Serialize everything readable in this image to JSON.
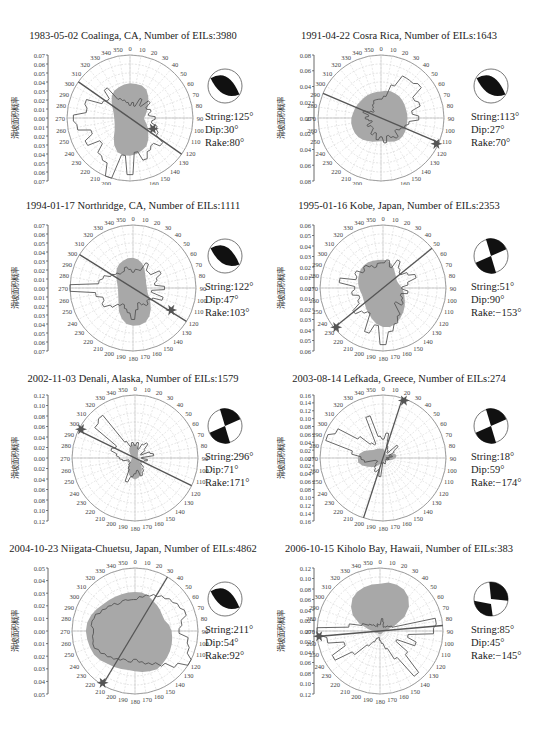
{
  "ylabel": "滑坡面积概率",
  "chart_data": [
    {
      "type": "rose",
      "title": "1983-05-02 Coalinga, CA, Number of EILs:3980",
      "event": "1983-05-02 Coalinga, CA",
      "num_eils": 3980,
      "ylabel": "滑坡面积概率",
      "yticks": [
        "0.07",
        "0.06",
        "0.05",
        "0.04",
        "0.03",
        "0.02",
        "0.01",
        "0.00",
        "0.01",
        "0.02",
        "0.03",
        "0.04",
        "0.05",
        "0.06",
        "0.07"
      ],
      "ylim": [
        0,
        0.07
      ],
      "angle_ticks": [
        0,
        10,
        20,
        30,
        40,
        50,
        60,
        70,
        80,
        90,
        100,
        110,
        120,
        130,
        140,
        150,
        160,
        170,
        180,
        190,
        200,
        210,
        220,
        230,
        240,
        250,
        260,
        270,
        280,
        290,
        300,
        310,
        320,
        330,
        340,
        350
      ],
      "focal_mechanism": {
        "strike": "String:125°",
        "dip": "Dip:30°",
        "rake": "Rake:80°"
      },
      "fault_line_azimuth": 125,
      "epicenter_azimuth": 115
    },
    {
      "type": "rose",
      "title": "1991-04-22 Cosra Rica, Number of EILs:1643",
      "event": "1991-04-22 Cosra Rica",
      "num_eils": 1643,
      "ylabel": "滑坡面积概率",
      "yticks": [
        "0.08",
        "0.06",
        "0.04",
        "0.02",
        "0.00",
        "0.02",
        "0.04",
        "0.06",
        "0.08"
      ],
      "ylim": [
        0,
        0.08
      ],
      "angle_ticks": [
        0,
        10,
        20,
        30,
        40,
        50,
        60,
        70,
        80,
        90,
        100,
        110,
        120,
        130,
        140,
        150,
        160,
        170,
        180,
        190,
        200,
        210,
        220,
        230,
        240,
        250,
        260,
        270,
        280,
        290,
        300,
        310,
        320,
        330,
        340,
        350
      ],
      "focal_mechanism": {
        "strike": "String:113°",
        "dip": "Dip:27°",
        "rake": "Rake:70°"
      },
      "fault_line_azimuth": 113,
      "epicenter_azimuth": 115
    },
    {
      "type": "rose",
      "title": "1994-01-17 Northridge, CA, Number of EILs:1111",
      "event": "1994-01-17 Northridge, CA",
      "num_eils": 1111,
      "ylabel": "滑坡面积概率",
      "yticks": [
        "0.07",
        "0.06",
        "0.05",
        "0.04",
        "0.03",
        "0.02",
        "0.01",
        "0.00",
        "0.01",
        "0.02",
        "0.03",
        "0.04",
        "0.05",
        "0.06",
        "0.07"
      ],
      "ylim": [
        0,
        0.07
      ],
      "angle_ticks": [
        0,
        10,
        20,
        30,
        40,
        50,
        60,
        70,
        80,
        90,
        100,
        110,
        120,
        130,
        140,
        150,
        160,
        170,
        180,
        190,
        200,
        210,
        220,
        230,
        240,
        250,
        260,
        270,
        280,
        290,
        300,
        310,
        320,
        330,
        340,
        350
      ],
      "focal_mechanism": {
        "strike": "String:122°",
        "dip": "Dip:47°",
        "rake": "Rake:103°"
      },
      "fault_line_azimuth": 122,
      "epicenter_azimuth": 120
    },
    {
      "type": "rose",
      "title": "1995-01-16 Kobe, Japan, Number of EILs:2353",
      "event": "1995-01-16 Kobe, Japan",
      "num_eils": 2353,
      "ylabel": "滑坡面积概率",
      "yticks": [
        "0.06",
        "0.05",
        "0.04",
        "0.03",
        "0.02",
        "0.01",
        "0.00",
        "0.01",
        "0.02",
        "0.03",
        "0.04",
        "0.05",
        "0.06"
      ],
      "ylim": [
        0,
        0.06
      ],
      "angle_ticks": [
        0,
        10,
        20,
        30,
        40,
        50,
        60,
        70,
        80,
        90,
        100,
        110,
        120,
        130,
        140,
        150,
        160,
        170,
        180,
        190,
        200,
        210,
        220,
        230,
        240,
        250,
        260,
        270,
        280,
        290,
        300,
        310,
        320,
        330,
        340,
        350
      ],
      "focal_mechanism": {
        "strike": "String:51°",
        "dip": "Dip:90°",
        "rake": "Rake:−153°"
      },
      "fault_line_azimuth": 51,
      "epicenter_azimuth": 230
    },
    {
      "type": "rose",
      "title": "2002-11-03 Denali, Alaska, Number of EILs:1579",
      "event": "2002-11-03 Denali, Alaska",
      "num_eils": 1579,
      "ylabel": "滑坡面积概率",
      "yticks": [
        "0.12",
        "0.10",
        "0.08",
        "0.06",
        "0.04",
        "0.02",
        "0.00",
        "0.02",
        "0.04",
        "0.06",
        "0.08",
        "0.10",
        "0.12"
      ],
      "ylim": [
        0,
        0.12
      ],
      "angle_ticks": [
        0,
        10,
        20,
        30,
        40,
        50,
        60,
        70,
        80,
        90,
        100,
        110,
        120,
        130,
        140,
        150,
        160,
        170,
        180,
        190,
        200,
        210,
        220,
        230,
        240,
        250,
        260,
        270,
        280,
        290,
        300,
        310,
        320,
        330,
        340,
        350
      ],
      "focal_mechanism": {
        "strike": "String:296°",
        "dip": "Dip:71°",
        "rake": "Rake:171°"
      },
      "fault_line_azimuth": 296,
      "epicenter_azimuth": 298
    },
    {
      "type": "rose",
      "title": "2003-08-14 Lefkada, Greece, Number of EILs:274",
      "event": "2003-08-14 Lefkada, Greece",
      "num_eils": 274,
      "ylabel": "滑坡面积概率",
      "yticks": [
        "0.16",
        "0.14",
        "0.12",
        "0.10",
        "0.08",
        "0.06",
        "0.04",
        "0.02",
        "0.00",
        "0.02",
        "0.04",
        "0.06",
        "0.08",
        "0.10",
        "0.12",
        "0.14",
        "0.16"
      ],
      "ylim": [
        0,
        0.16
      ],
      "angle_ticks": [
        0,
        10,
        20,
        30,
        40,
        50,
        60,
        70,
        80,
        90,
        100,
        110,
        120,
        130,
        140,
        150,
        160,
        170,
        180,
        190,
        200,
        210,
        220,
        230,
        240,
        250,
        260,
        270,
        280,
        290,
        300,
        310,
        320,
        330,
        340,
        350
      ],
      "focal_mechanism": {
        "strike": "String:18°",
        "dip": "Dip:59°",
        "rake": "Rake:−174°"
      },
      "fault_line_azimuth": 18,
      "epicenter_azimuth": 20
    },
    {
      "type": "rose",
      "title": "2004-10-23 Niigata-Chuetsu, Japan, Number of EILs:4862",
      "event": "2004-10-23 Niigata-Chuetsu, Japan",
      "num_eils": 4862,
      "ylabel": "滑坡面积概率",
      "yticks": [
        "0.05",
        "0.04",
        "0.03",
        "0.02",
        "0.01",
        "0.00",
        "0.01",
        "0.02",
        "0.03",
        "0.04",
        "0.05"
      ],
      "ylim": [
        0,
        0.05
      ],
      "angle_ticks": [
        0,
        10,
        20,
        30,
        40,
        50,
        60,
        70,
        80,
        90,
        100,
        110,
        120,
        130,
        140,
        150,
        160,
        170,
        180,
        190,
        200,
        210,
        220,
        230,
        240,
        250,
        260,
        270,
        280,
        290,
        300,
        310,
        320,
        330,
        340,
        350
      ],
      "focal_mechanism": {
        "strike": "String:211°",
        "dip": "Dip:54°",
        "rake": "Rake:92°"
      },
      "fault_line_azimuth": 211,
      "epicenter_azimuth": 212
    },
    {
      "type": "rose",
      "title": "2006-10-15 Kiholo Bay, Hawaii, Number of EILs:383",
      "event": "2006-10-15 Kiholo Bay, Hawaii",
      "num_eils": 383,
      "ylabel": "滑坡面积概率",
      "yticks": [
        "0.12",
        "0.10",
        "0.08",
        "0.06",
        "0.04",
        "0.02",
        "0.00",
        "0.02",
        "0.04",
        "0.06",
        "0.08",
        "0.10",
        "0.12"
      ],
      "ylim": [
        0,
        0.12
      ],
      "angle_ticks": [
        0,
        10,
        20,
        30,
        40,
        50,
        60,
        70,
        80,
        90,
        100,
        110,
        120,
        130,
        140,
        150,
        160,
        170,
        180,
        190,
        200,
        210,
        220,
        230,
        240,
        250,
        260,
        270,
        280,
        290,
        300,
        310,
        320,
        330,
        340,
        350
      ],
      "focal_mechanism": {
        "strike": "String:85°",
        "dip": "Dip:45°",
        "rake": "Rake:−145°"
      },
      "fault_line_azimuth": 85,
      "epicenter_azimuth": 265
    }
  ]
}
